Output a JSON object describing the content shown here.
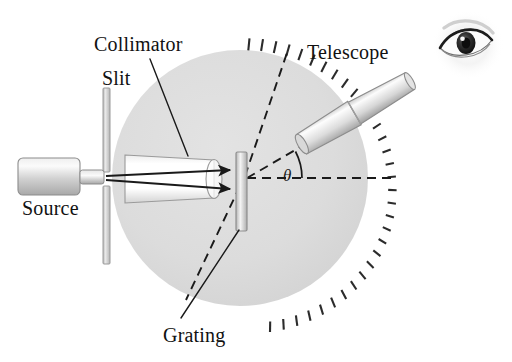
{
  "figure": {
    "width": 512,
    "height": 362,
    "background_color": "#ffffff"
  },
  "labels": {
    "collimator": "Collimator",
    "slit": "Slit",
    "telescope": "Telescope",
    "source": "Source",
    "grating": "Grating",
    "theta": "θ"
  },
  "colors": {
    "disk_fill": "#dcdcdc",
    "disk_edge": "#cfcfcf",
    "tick_mark": "#2b2b2b",
    "ray_line": "#1a1a1a",
    "dashed_line": "#1a1a1a",
    "leader_line": "#1a1a1a",
    "tube_light": "#f2f2f2",
    "tube_mid": "#c9c9c9",
    "tube_dark": "#9a9a9a",
    "tube_outline": "#8c8c8c",
    "bar_fill": "#cfcfcf",
    "bar_outline": "#9a9a9a",
    "text": "#111111",
    "eye_iris": "#2a2a2a"
  },
  "geometry": {
    "disk_center_x": 240,
    "disk_center_y": 178,
    "disk_radius": 128,
    "tick_count": 30,
    "tick_span_start_deg": -75,
    "tick_span_end_deg": 78,
    "theta_value_deg": 30,
    "optical_axis_y": 178,
    "telescope_angle_deg": -30
  },
  "components": {
    "source": {
      "name": "light-source-lamp",
      "x": 18,
      "y": 158,
      "width": 62,
      "height": 36
    },
    "slit": {
      "name": "slit-aperture",
      "x": 103,
      "y": 88,
      "width": 7,
      "height": 176,
      "gap_top": 172,
      "gap_bottom": 186
    },
    "collimator": {
      "name": "collimator-tube",
      "x": 125,
      "y": 155,
      "width": 93,
      "height": 48
    },
    "grating": {
      "name": "diffraction-grating-plate",
      "x": 236,
      "y": 152,
      "width": 10,
      "height": 78
    },
    "telescope": {
      "name": "telescope-tube",
      "pivot_x": 243,
      "pivot_y": 178,
      "near_radius": 70,
      "far_radius": 205
    },
    "eye": {
      "name": "observer-eye",
      "cx": 468,
      "cy": 45,
      "rx": 33,
      "ry": 32
    }
  }
}
